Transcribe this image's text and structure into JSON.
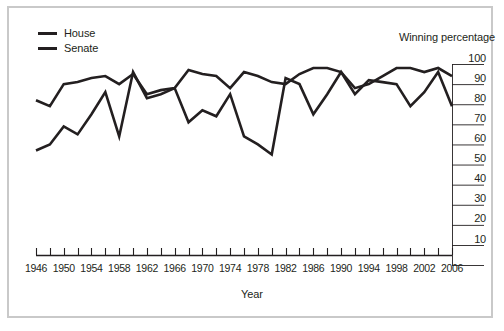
{
  "chart_data": {
    "type": "line",
    "title": "",
    "xlabel": "Year",
    "ylabel": "Winning percentage",
    "ylim": [
      0,
      100
    ],
    "xlim": [
      1946,
      2006
    ],
    "grid": false,
    "legend_position": "top-left",
    "ytick_labels": [
      "100",
      "90",
      "80",
      "70",
      "60",
      "50",
      "40",
      "30",
      "20",
      "10"
    ],
    "ytick_values": [
      100,
      90,
      80,
      70,
      60,
      50,
      40,
      30,
      20,
      10
    ],
    "xtick_labels": [
      "1946",
      "1950",
      "1954",
      "1958",
      "1962",
      "1966",
      "1970",
      "1974",
      "1978",
      "1982",
      "1986",
      "1990",
      "1994",
      "1998",
      "2002",
      "2006"
    ],
    "xtick_values": [
      1946,
      1950,
      1954,
      1958,
      1962,
      1966,
      1970,
      1974,
      1978,
      1982,
      1986,
      1990,
      1994,
      1998,
      2002,
      2006
    ],
    "minor_xticks": [
      1946,
      1948,
      1950,
      1952,
      1954,
      1956,
      1958,
      1960,
      1962,
      1964,
      1966,
      1968,
      1970,
      1972,
      1974,
      1976,
      1978,
      1980,
      1982,
      1984,
      1986,
      1988,
      1990,
      1992,
      1994,
      1996,
      1998,
      2000,
      2002,
      2004,
      2006
    ],
    "x": [
      1946,
      1948,
      1950,
      1952,
      1954,
      1956,
      1958,
      1960,
      1962,
      1964,
      1966,
      1968,
      1970,
      1972,
      1974,
      1976,
      1978,
      1980,
      1982,
      1984,
      1986,
      1988,
      1990,
      1992,
      1994,
      1996,
      1998,
      2000,
      2002,
      2004,
      2006
    ],
    "series": [
      {
        "name": "House",
        "color": "#231f20",
        "values": [
          82,
          79,
          90,
          91,
          93,
          94,
          90,
          95,
          85,
          87,
          88,
          97,
          95,
          94,
          88,
          96,
          94,
          91,
          90,
          95,
          98,
          98,
          96,
          88,
          90,
          94,
          98,
          98,
          96,
          98,
          94
        ]
      },
      {
        "name": "Senate",
        "color": "#231f20",
        "values": [
          57,
          60,
          69,
          65,
          75,
          86,
          64,
          96,
          83,
          85,
          88,
          71,
          77,
          74,
          85,
          64,
          60,
          55,
          93,
          90,
          75,
          85,
          96,
          85,
          92,
          91,
          90,
          79,
          86,
          96,
          79
        ]
      }
    ]
  },
  "legend": {
    "items": [
      {
        "label": "House"
      },
      {
        "label": "Senate"
      }
    ]
  },
  "axes": {
    "y_title": "Winning percentage",
    "x_title": "Year"
  }
}
